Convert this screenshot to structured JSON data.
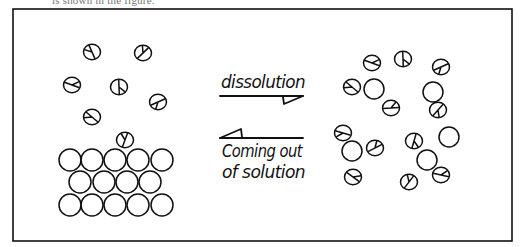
{
  "caption": "is shown in the figure.",
  "diagram": {
    "frame": {
      "x": 13,
      "y": 9,
      "width": 499,
      "height": 232,
      "stroke": "#111111"
    },
    "colors": {
      "ink": "#111111",
      "background": "#ffffff"
    },
    "labels": {
      "forward": "dissolution",
      "reverse_line1": "Coming out",
      "reverse_line2": "of solution"
    },
    "arrows": {
      "forward": {
        "direction": "right",
        "y": 96,
        "x_start": 220,
        "x_end": 303
      },
      "reverse": {
        "direction": "left",
        "y": 138,
        "x_start": 220,
        "x_end": 303
      }
    },
    "left_side": {
      "description": "solid lattice with dissolved particles above",
      "lattice_rows": [
        {
          "y": 160,
          "x": [
            70,
            92,
            115,
            138,
            162
          ]
        },
        {
          "y": 182,
          "x": [
            80,
            104,
            127,
            150
          ]
        },
        {
          "y": 205,
          "x": [
            70,
            92,
            115,
            138,
            162
          ]
        }
      ],
      "free_particles": [
        {
          "x": 92,
          "y": 52,
          "type": "split"
        },
        {
          "x": 143,
          "y": 53,
          "type": "split"
        },
        {
          "x": 72,
          "y": 85,
          "type": "split"
        },
        {
          "x": 119,
          "y": 87,
          "type": "split"
        },
        {
          "x": 158,
          "y": 102,
          "type": "split"
        },
        {
          "x": 92,
          "y": 117,
          "type": "split"
        },
        {
          "x": 125,
          "y": 140,
          "type": "split"
        }
      ]
    },
    "right_side": {
      "description": "dissolved solute particles among solvent molecules",
      "particles": [
        {
          "x": 372,
          "y": 63,
          "type": "split"
        },
        {
          "x": 403,
          "y": 59,
          "type": "split"
        },
        {
          "x": 441,
          "y": 67,
          "type": "split"
        },
        {
          "x": 352,
          "y": 87,
          "type": "split"
        },
        {
          "x": 374,
          "y": 89,
          "type": "plain"
        },
        {
          "x": 391,
          "y": 108,
          "type": "split"
        },
        {
          "x": 433,
          "y": 92,
          "type": "plain"
        },
        {
          "x": 438,
          "y": 110,
          "type": "split"
        },
        {
          "x": 343,
          "y": 133,
          "type": "split"
        },
        {
          "x": 352,
          "y": 151,
          "type": "plain"
        },
        {
          "x": 375,
          "y": 148,
          "type": "split"
        },
        {
          "x": 353,
          "y": 177,
          "type": "split"
        },
        {
          "x": 414,
          "y": 141,
          "type": "split"
        },
        {
          "x": 449,
          "y": 137,
          "type": "plain"
        },
        {
          "x": 427,
          "y": 160,
          "type": "plain"
        },
        {
          "x": 409,
          "y": 182,
          "type": "split"
        },
        {
          "x": 441,
          "y": 175,
          "type": "split"
        }
      ]
    }
  }
}
